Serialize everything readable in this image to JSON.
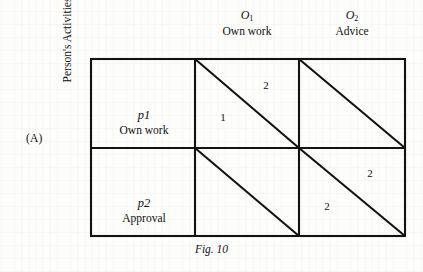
{
  "figure": {
    "panel_letter": "(A)",
    "caption": "Fig. 10",
    "y_axis_label": "Person's Activities"
  },
  "columns": [
    {
      "symbol": "O",
      "subscript": "1",
      "name": "Own work"
    },
    {
      "symbol": "O",
      "subscript": "2",
      "name": "Advice"
    }
  ],
  "rows": [
    {
      "symbol": "p",
      "index": "1",
      "name": "Own work"
    },
    {
      "symbol": "p",
      "index": "2",
      "name": "Approval"
    }
  ],
  "cells": {
    "r1c1": {
      "lower": "1",
      "upper": "2"
    },
    "r1c2": {
      "lower": "",
      "upper": ""
    },
    "r2c1": {
      "lower": "",
      "upper": ""
    },
    "r2c2": {
      "lower": "2",
      "upper": "2"
    }
  },
  "colors": {
    "ink": "#111111",
    "paper": "#fdfdfc"
  }
}
